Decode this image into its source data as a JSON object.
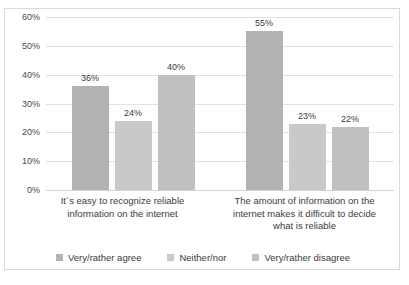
{
  "chart_data": {
    "type": "bar",
    "title": "",
    "xlabel": "",
    "ylabel": "",
    "ylim": [
      0,
      60
    ],
    "ytick_labels": [
      "60%",
      "50%",
      "40%",
      "30%",
      "20%",
      "10%",
      "0%"
    ],
    "ytick_values": [
      60,
      50,
      40,
      30,
      20,
      10,
      0
    ],
    "grid": true,
    "legend_position": "bottom",
    "categories": [
      "It´s easy to recognize reliable information on the internet",
      "The amount of information on the internet makes it difficult to decide what is reliable"
    ],
    "category_lines": [
      [
        "It´s easy to recognize reliable",
        "information on the internet"
      ],
      [
        "The amount of information on the",
        "internet makes it difficult to decide",
        "what is reliable"
      ]
    ],
    "series": [
      {
        "name": "Very/rather agree",
        "color": "#b2b2b2",
        "values": [
          36,
          55
        ],
        "labels": [
          "36%",
          "55%"
        ]
      },
      {
        "name": "Neither/nor",
        "color": "#c9c9c9",
        "values": [
          24,
          23
        ],
        "labels": [
          "24%",
          "23%"
        ]
      },
      {
        "name": "Very/rather disagree",
        "color": "#c0c0c0",
        "values": [
          40,
          22
        ],
        "labels": [
          "40%",
          "22%"
        ]
      }
    ]
  }
}
